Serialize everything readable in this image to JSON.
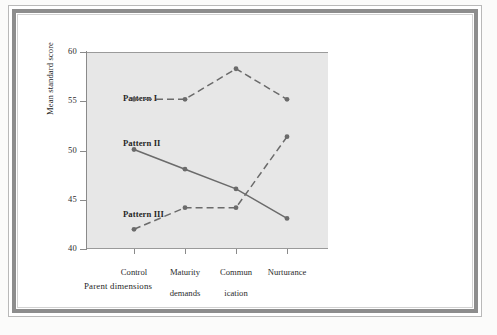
{
  "chart_data": {
    "type": "line",
    "title": "",
    "xlabel": "Parent dimensions",
    "ylabel": "Mean standard score",
    "categories": [
      "Control",
      "Maturity\ndemands",
      "Commun\nication",
      "Nurturance"
    ],
    "x_tick_labels": [
      "Control",
      "Maturity demands",
      "Commun ication",
      "Nurturance"
    ],
    "y_tick_labels": [
      "40",
      "45",
      "50",
      "55",
      "60"
    ],
    "y_ticks": [
      40,
      45,
      50,
      55,
      60
    ],
    "ylim": [
      40,
      60
    ],
    "grid": false,
    "legend_position": "inline-labels",
    "series": [
      {
        "name": "Pattern I",
        "values": [
          55.2,
          55.2,
          58.3,
          55.2
        ],
        "style": "dashed",
        "color": "#6b6b6b",
        "label_x": 134,
        "label_y": 55.9
      },
      {
        "name": "Pattern II",
        "values": [
          50.1,
          48.1,
          46.1,
          43.1
        ],
        "style": "solid",
        "color": "#6b6b6b",
        "label_x": 134,
        "label_y": 51.2
      },
      {
        "name": "Pattern III",
        "values": [
          42.0,
          44.2,
          44.2,
          51.4
        ],
        "style": "dashed",
        "color": "#6b6b6b",
        "label_x": 134,
        "label_y": 44.0
      }
    ]
  },
  "axis": {
    "y_title": "Mean standard score",
    "x_title": "Parent dimensions",
    "y_labels": {
      "t40": "40",
      "t45": "45",
      "t50": "50",
      "t55": "55",
      "t60": "60"
    },
    "x_labels": {
      "c1": "Control",
      "c2_line1": "Maturity",
      "c2_line2": "demands",
      "c3_line1": "Commun",
      "c3_line2": "ication",
      "c4": "Nurturance"
    }
  },
  "series_labels": {
    "pattern1": "Pattern I",
    "pattern2": "Pattern II",
    "pattern3": "Pattern III"
  },
  "colors": {
    "plot_background": "#e7e7e7",
    "line": "#6b6b6b",
    "axis": "#8a8a8a",
    "frame": "#8d8d8d",
    "text": "#1f1f1f"
  }
}
